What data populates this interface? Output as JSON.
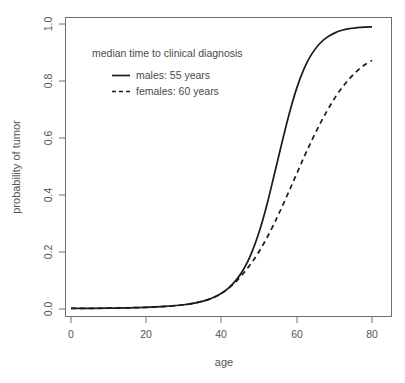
{
  "chart_data": {
    "type": "line",
    "title": "",
    "xlabel": "age",
    "ylabel": "probability of tumor",
    "xlim": [
      0,
      82
    ],
    "ylim": [
      0.0,
      1.0
    ],
    "grid": false,
    "legend_position": "upper-left-inside",
    "legend_title": "median time to clinical diagnosis",
    "xticks": [
      0,
      20,
      40,
      60,
      80
    ],
    "xtick_labels": [
      "0",
      "20",
      "40",
      "60",
      "80"
    ],
    "yticks": [
      0.0,
      0.2,
      0.4,
      0.6,
      0.8,
      1.0
    ],
    "ytick_labels": [
      "0.0",
      "0.2",
      "0.4",
      "0.6",
      "0.8",
      "1.0"
    ],
    "x": [
      0,
      5,
      10,
      15,
      20,
      25,
      30,
      32,
      34,
      36,
      38,
      40,
      42,
      44,
      46,
      48,
      50,
      52,
      54,
      55,
      56,
      58,
      60,
      62,
      64,
      66,
      68,
      70,
      72,
      74,
      76,
      78,
      80
    ],
    "series": [
      {
        "name": "males: 55 years",
        "label": "males: 55 years",
        "style": "solid",
        "color": "#1a1a1a",
        "median": 55,
        "values": [
          0.002,
          0.002,
          0.003,
          0.004,
          0.006,
          0.009,
          0.015,
          0.019,
          0.024,
          0.031,
          0.041,
          0.055,
          0.075,
          0.103,
          0.142,
          0.197,
          0.27,
          0.362,
          0.47,
          0.525,
          0.58,
          0.685,
          0.775,
          0.845,
          0.895,
          0.93,
          0.953,
          0.968,
          0.978,
          0.984,
          0.987,
          0.989,
          0.99
        ]
      },
      {
        "name": "females: 60 years",
        "label": "females: 60 years",
        "style": "dashed",
        "color": "#1a1a1a",
        "median": 60,
        "values": [
          0.002,
          0.002,
          0.003,
          0.004,
          0.006,
          0.009,
          0.015,
          0.019,
          0.024,
          0.031,
          0.041,
          0.055,
          0.074,
          0.098,
          0.128,
          0.162,
          0.202,
          0.248,
          0.3,
          0.328,
          0.356,
          0.415,
          0.475,
          0.535,
          0.592,
          0.645,
          0.694,
          0.738,
          0.776,
          0.808,
          0.835,
          0.856,
          0.872
        ]
      }
    ],
    "annotations": []
  },
  "figure": {
    "caption_fragment": ""
  }
}
